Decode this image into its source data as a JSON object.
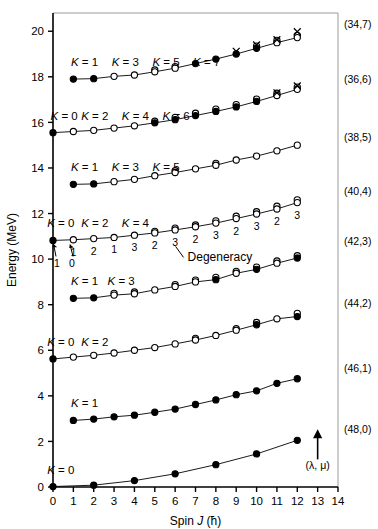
{
  "figure": {
    "axis_title_x": "Spin J (ħ)",
    "axis_title_x_parts": {
      "pre": "Spin ",
      "ital": "J",
      "post": " (ħ)"
    },
    "axis_title_y": "Energy (MeV)",
    "degeneracy_label": "Degeneracy",
    "lambda_mu_label": "(λ, μ)",
    "line_color": "#000000",
    "text_color": "#000000",
    "background": "#ffffff"
  },
  "chart_data": {
    "type": "scatter",
    "title": "",
    "xlabel": "Spin J (ħ)",
    "ylabel": "Energy (MeV)",
    "xlim": [
      0,
      14
    ],
    "ylim": [
      0,
      20.8
    ],
    "xticks": [
      0,
      1,
      2,
      3,
      4,
      5,
      6,
      7,
      8,
      9,
      10,
      11,
      12,
      13,
      14
    ],
    "yticks": [
      0,
      2,
      4,
      6,
      8,
      10,
      12,
      14,
      16,
      18,
      20
    ],
    "grid": false,
    "legend": "none",
    "annotations": [
      {
        "text": "Degeneracy",
        "x": 7.2,
        "y": 10.25
      },
      {
        "text": "(λ, μ)",
        "x": 13.0,
        "y": 0.95
      }
    ],
    "series": [
      {
        "name": "(34,7)",
        "band_label": "(34,7)",
        "K_label": "K = 1",
        "K_labels": [
          "K = 1",
          "K = 3",
          "K = 5",
          "K = 7"
        ],
        "K_label_x": [
          1.55,
          3.55,
          5.55,
          7.55
        ],
        "band_label_y": 20.15,
        "x": [
          1,
          2,
          3,
          4,
          5,
          6,
          7,
          8,
          9,
          10,
          11,
          12
        ],
        "y": [
          17.9,
          17.92,
          18.02,
          18.08,
          18.22,
          18.38,
          18.58,
          18.78,
          19.0,
          19.25,
          19.5,
          19.72
        ],
        "markers": [
          "filled",
          "filled",
          "open",
          "open",
          "open",
          "open",
          "filled",
          "filled",
          "filled",
          "filled",
          "open",
          "open"
        ],
        "extra_open": [
          null,
          null,
          null,
          null,
          18.3,
          18.45,
          null,
          null,
          null,
          19.35,
          19.6,
          19.82
        ],
        "cross_x": [
          9,
          10,
          11,
          12
        ],
        "cross_y": [
          19.12,
          19.4,
          19.63,
          19.98
        ]
      },
      {
        "name": "(36,6)",
        "band_label": "(36,6)",
        "K_labels": [
          "K = 0",
          "K = 2",
          "K = 4",
          "K = 6"
        ],
        "K_label_x": [
          0.55,
          2.05,
          4.05,
          6.05
        ],
        "band_label_y": 17.72,
        "x": [
          0,
          1,
          2,
          3,
          4,
          5,
          6,
          7,
          8,
          9,
          10,
          11,
          12
        ],
        "y": [
          15.55,
          15.6,
          15.65,
          15.75,
          15.85,
          15.98,
          16.12,
          16.3,
          16.48,
          16.68,
          16.92,
          17.18,
          17.45
        ],
        "markers": [
          "filled",
          "open",
          "open",
          "open",
          "open",
          "filled",
          "filled",
          "filled",
          "filled",
          "filled",
          "filled",
          "open",
          "open"
        ],
        "extra_open": [
          null,
          null,
          null,
          null,
          null,
          16.05,
          16.22,
          16.4,
          16.58,
          16.78,
          17.02,
          17.28,
          17.55
        ],
        "cross_x": [
          11,
          12
        ],
        "cross_y": [
          17.3,
          17.6
        ]
      },
      {
        "name": "(38,5)",
        "band_label": "(38,5)",
        "K_labels": [
          "K = 1",
          "K = 3",
          "K = 5"
        ],
        "K_label_x": [
          1.55,
          3.55,
          5.55
        ],
        "band_label_y": 15.2,
        "x": [
          1,
          2,
          3,
          4,
          5,
          6,
          7,
          8,
          9,
          10,
          11,
          12
        ],
        "y": [
          13.28,
          13.3,
          13.4,
          13.5,
          13.66,
          13.8,
          13.96,
          14.12,
          14.35,
          14.52,
          14.75,
          15.0
        ],
        "markers": [
          "filled",
          "filled",
          "open",
          "open",
          "open",
          "open",
          "open",
          "open",
          "open",
          "open",
          "open",
          "open"
        ],
        "extra_open": [
          null,
          null,
          null,
          null,
          null,
          13.88,
          null,
          14.2,
          null,
          null,
          null,
          null
        ],
        "cross_x": [],
        "cross_y": []
      },
      {
        "name": "(40,4)",
        "band_label": "(40,4)",
        "K_labels": [
          "K = 0",
          "K = 2",
          "K = 4"
        ],
        "K_label_x": [
          0.38,
          2.05,
          4.05
        ],
        "band_label_y": 12.8,
        "x": [
          0,
          1,
          2,
          3,
          4,
          5,
          6,
          7,
          8,
          9,
          10,
          11,
          12
        ],
        "y": [
          10.82,
          10.85,
          10.9,
          10.95,
          11.05,
          11.15,
          11.28,
          11.42,
          11.58,
          11.78,
          11.98,
          12.2,
          12.48
        ],
        "markers": [
          "filled",
          "open",
          "open",
          "open",
          "open",
          "open",
          "open",
          "open",
          "open",
          "open",
          "open",
          "open",
          "open"
        ],
        "extra_open": [
          null,
          null,
          null,
          null,
          null,
          11.22,
          11.36,
          11.5,
          11.68,
          11.88,
          12.08,
          12.32,
          12.6
        ],
        "degeneracy": [
          null,
          "1",
          "2",
          "1",
          "3",
          "2",
          "3",
          "2",
          "3",
          "2",
          "3",
          "2",
          "3"
        ],
        "arrow_labels": [
          "1",
          "0"
        ],
        "cross_x": [],
        "cross_y": []
      },
      {
        "name": "(42,3)",
        "band_label": "(42,3)",
        "K_labels": [
          "K = 1",
          "K = 3"
        ],
        "K_label_x": [
          1.55,
          3.35
        ],
        "band_label_y": 10.6,
        "x": [
          1,
          2,
          3,
          4,
          5,
          6,
          7,
          8,
          9,
          10,
          11,
          12
        ],
        "y": [
          8.28,
          8.3,
          8.42,
          8.48,
          8.65,
          8.8,
          9.0,
          9.1,
          9.38,
          9.55,
          9.82,
          10.05
        ],
        "markers": [
          "filled",
          "filled",
          "open",
          "open",
          "open",
          "open",
          "open",
          "filled",
          "open",
          "filled",
          "open",
          "filled"
        ],
        "extra_open": [
          null,
          null,
          8.5,
          8.56,
          null,
          8.88,
          9.08,
          9.2,
          9.46,
          9.65,
          9.92,
          10.15
        ],
        "cross_x": [],
        "cross_y": []
      },
      {
        "name": "(44,2)",
        "band_label": "(44,2)",
        "K_labels": [
          "K = 0",
          "K = 2"
        ],
        "K_label_x": [
          0.38,
          2.05
        ],
        "band_label_y": 7.88,
        "x": [
          0,
          1,
          2,
          3,
          4,
          5,
          6,
          7,
          8,
          9,
          10,
          11,
          12
        ],
        "y": [
          5.62,
          5.7,
          5.78,
          5.88,
          6.0,
          6.12,
          6.28,
          6.45,
          6.65,
          6.88,
          7.12,
          7.38,
          7.48
        ],
        "markers": [
          "filled",
          "open",
          "open",
          "open",
          "open",
          "open",
          "open",
          "open",
          "open",
          "open",
          "filled",
          "open",
          "filled"
        ],
        "extra_open": [
          null,
          null,
          null,
          null,
          null,
          null,
          null,
          6.52,
          null,
          6.95,
          7.22,
          null,
          7.62
        ],
        "cross_x": [],
        "cross_y": []
      },
      {
        "name": "(46,1)",
        "band_label": "(46,1)",
        "K_labels": [
          "K = 1"
        ],
        "K_label_x": [
          1.55
        ],
        "band_label_y": 5.05,
        "x": [
          1,
          2,
          3,
          4,
          5,
          6,
          7,
          8,
          9,
          10,
          11,
          12
        ],
        "y": [
          2.92,
          2.98,
          3.08,
          3.15,
          3.28,
          3.42,
          3.62,
          3.82,
          4.05,
          4.22,
          4.55,
          4.75
        ],
        "markers": [
          "filled",
          "filled",
          "filled",
          "filled",
          "filled",
          "filled",
          "filled",
          "filled",
          "filled",
          "filled",
          "filled",
          "filled"
        ],
        "extra_open": [],
        "cross_x": [],
        "cross_y": []
      },
      {
        "name": "(48,0)",
        "band_label": "(48,0)",
        "K_labels": [
          "K = 0"
        ],
        "K_label_x": [
          0.38
        ],
        "band_label_y": 2.35,
        "x": [
          0,
          2,
          4,
          6,
          8,
          10,
          12
        ],
        "y": [
          0.02,
          0.08,
          0.28,
          0.58,
          0.98,
          1.45,
          2.05
        ],
        "markers": [
          "filled",
          "filled",
          "filled",
          "filled",
          "filled",
          "filled",
          "filled"
        ],
        "extra_open": [],
        "cross_x": [],
        "cross_y": []
      }
    ]
  }
}
